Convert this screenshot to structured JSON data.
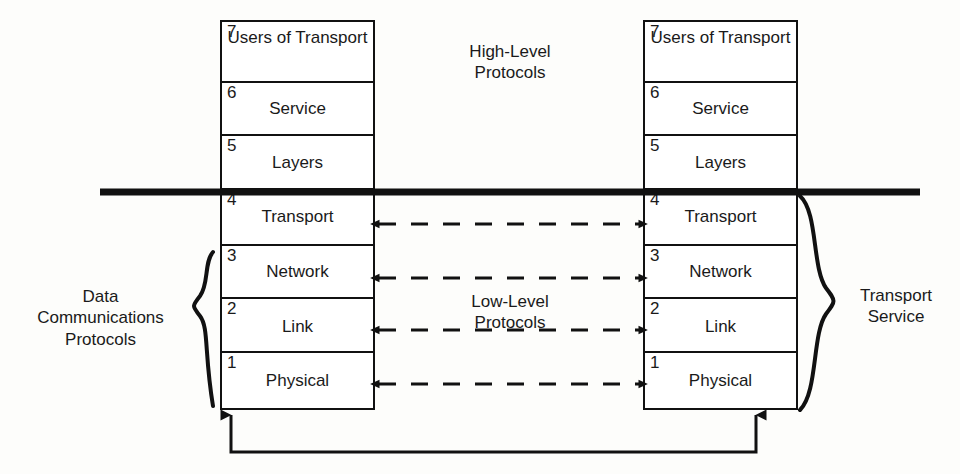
{
  "diagram": {
    "colors": {
      "line": "#111111",
      "text": "#1a1a1a",
      "background": "#fdfdfb"
    },
    "left_stack": {
      "name": "left-protocol-stack",
      "layers": [
        {
          "number": "7",
          "label": "Users of\nTransport"
        },
        {
          "number": "6",
          "label": "Service"
        },
        {
          "number": "5",
          "label": "Layers"
        },
        {
          "number": "4",
          "label": "Transport"
        },
        {
          "number": "3",
          "label": "Network"
        },
        {
          "number": "2",
          "label": "Link"
        },
        {
          "number": "1",
          "label": "Physical"
        }
      ]
    },
    "right_stack": {
      "name": "right-protocol-stack",
      "layers": [
        {
          "number": "7",
          "label": "Users of\nTransport"
        },
        {
          "number": "6",
          "label": "Service"
        },
        {
          "number": "5",
          "label": "Layers"
        },
        {
          "number": "4",
          "label": "Transport"
        },
        {
          "number": "3",
          "label": "Network"
        },
        {
          "number": "2",
          "label": "Link"
        },
        {
          "number": "1",
          "label": "Physical"
        }
      ]
    },
    "annotations": {
      "left_brace_label": "Data\nCommunications\nProtocols",
      "right_brace_label": "Transport\nService",
      "high_level_label": "High-Level\nProtocols",
      "low_level_label": "Low-Level\nProtocols"
    },
    "connections": {
      "dashed_peer_links": [
        {
          "layer": "4",
          "label": "Transport peer protocol link",
          "style": "dashed-double-arrow"
        },
        {
          "layer": "3",
          "label": "Network peer protocol link",
          "style": "dashed-double-arrow"
        },
        {
          "layer": "2",
          "label": "Link peer protocol link",
          "style": "dashed-double-arrow"
        },
        {
          "layer": "1",
          "label": "Physical peer protocol link",
          "style": "dashed-double-arrow"
        }
      ],
      "physical_medium": {
        "label": "Physical medium connection",
        "style": "solid-double-ended-up-arrow"
      },
      "divider": {
        "label": "High-level / low-level boundary",
        "style": "thick-solid-rule"
      }
    }
  }
}
